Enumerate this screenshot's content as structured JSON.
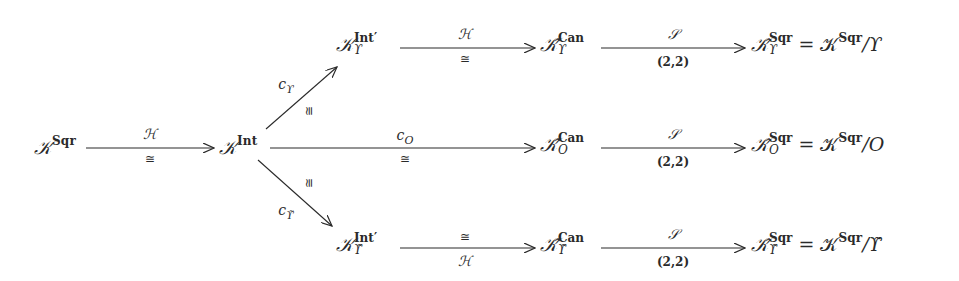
{
  "diagram": {
    "type": "commutative-diagram",
    "colors": {
      "ink": "#2a2a2a",
      "background": "#ffffff"
    },
    "nodes": {
      "k_sqr": {
        "base": "𝒦",
        "sup": "Sqr",
        "sub": ""
      },
      "k_int": {
        "base": "𝒦",
        "sup": "Int",
        "sub": ""
      },
      "k_int_prime_upsilon": {
        "base": "𝒦",
        "sup": "Int′",
        "sub": "ϒ"
      },
      "k_int_prime_upsilon_tilde": {
        "base": "𝒦",
        "sup": "Int′",
        "sub": "ϒ̃"
      },
      "k_can_upsilon": {
        "base": "𝒦̂",
        "sup": "Can",
        "sub": "ϒ"
      },
      "k_can_o": {
        "base": "𝒦̂",
        "sup": "Can",
        "sub": "O"
      },
      "k_can_upsilon_tilde": {
        "base": "𝒦̂",
        "sup": "Can",
        "sub": "ϒ̃"
      },
      "k_sqr_upsilon": {
        "base": "𝒦̂",
        "sup": "Sqr",
        "sub": "ϒ",
        "rhs": "= 𝒦",
        "rhs_sup": "Sqr",
        "rhs_tail": "/ϒ"
      },
      "k_sqr_o": {
        "base": "𝒦̂",
        "sup": "Sqr",
        "sub": "O",
        "rhs": "= 𝒦",
        "rhs_sup": "Sqr",
        "rhs_tail": "/O"
      },
      "k_sqr_upsilon_tilde": {
        "base": "𝒦̂",
        "sup": "Sqr",
        "sub": "ϒ̃",
        "rhs": "= 𝒦",
        "rhs_sup": "Sqr",
        "rhs_tail": "/ϒ̃"
      }
    },
    "arrows": {
      "h_main": {
        "above": "ℋ",
        "below": "≅"
      },
      "c_upsilon": {
        "label": "c",
        "label_sub": "ϒ",
        "iso": "≅"
      },
      "c_o": {
        "label": "c",
        "label_sub": "O",
        "iso": "≅"
      },
      "c_upsilon_tilde": {
        "label": "c",
        "label_sub": "ϒ̃",
        "iso": "≅"
      },
      "h_top": {
        "above": "ℋ",
        "below": "≅"
      },
      "h_bottom": {
        "above": "≅",
        "below": "ℋ"
      },
      "s_top": {
        "above": "𝒮",
        "below": "(2,2)"
      },
      "s_mid": {
        "above": "𝒮",
        "below": "(2,2)"
      },
      "s_bottom": {
        "above": "𝒮",
        "below": "(2,2)"
      }
    }
  }
}
